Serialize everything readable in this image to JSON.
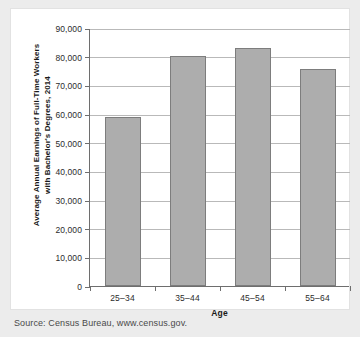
{
  "chart_data": {
    "type": "bar",
    "title": "",
    "categories": [
      "25–34",
      "35–44",
      "45–54",
      "55–64"
    ],
    "values": [
      59000,
      80200,
      83200,
      75700
    ],
    "series": [
      {
        "name": "Average Annual Earnings",
        "values": [
          59000,
          80200,
          83200,
          75700
        ]
      }
    ],
    "xlabel": "Age",
    "ylabel": "Average Annual Earnings of Full-Time Workers with Bachelor's Degrees, 2014",
    "ylabel_lines": [
      "Average Annual Earnings of Full-Time Workers",
      "with Bachelor's Degrees, 2014"
    ],
    "ylim": [
      0,
      90000
    ],
    "ytick_values": [
      0,
      10000,
      20000,
      30000,
      40000,
      50000,
      60000,
      70000,
      80000,
      90000
    ],
    "ytick_labels": [
      "0",
      "10,000",
      "20,000",
      "30,000",
      "40,000",
      "50,000",
      "60,000",
      "70,000",
      "80,000",
      "90,000"
    ],
    "grid": true,
    "grid_axis": "y",
    "legend": "none",
    "bar_color": "#adadad",
    "bar_border_color": "#7d7d7d",
    "axis_color": "#6e6e6e",
    "grid_color": "#b9b9b9",
    "background_color": "#ffffff",
    "page_background_color": "#ececec"
  },
  "source": {
    "text": "Source: Census Bureau, www.census.gov."
  }
}
